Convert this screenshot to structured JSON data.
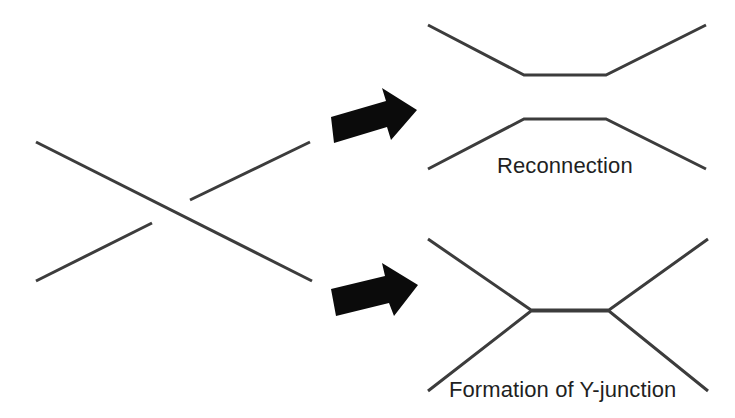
{
  "figure": {
    "background_color": "#ffffff",
    "stroke_color": "#3c3c3c",
    "arrow_color": "#0b0b0b",
    "text_color": "#221f1f"
  },
  "panels": {
    "left": {
      "name": "crossing-strands",
      "description": "Two straight strands crossing in an X, one broken at the crossing point"
    },
    "top_right": {
      "name": "reconnection-result",
      "caption": "Reconnection"
    },
    "bottom_right": {
      "name": "y-junction-result",
      "caption": "Formation of Y-junction"
    }
  },
  "captions": {
    "reconnection": "Reconnection",
    "y_junction": "Formation of Y-junction"
  },
  "geometry": {
    "crossing": {
      "descending_strand": "M36,142 L312,281",
      "ascending_segment_lower_left": "M36,281 L152,223",
      "ascending_segment_upper_right": "M190,200 L310,142"
    },
    "arrows": {
      "upper": "M331,117 L386,101 L382,88 L417,110 L391,140 L387,127 L334,143 Z",
      "lower": "M331,289 L385,276 L382,263 L418,285 L394,316 L389,303 L336,316 Z"
    },
    "reconnection_trough": "M428,25 L524,75 L606,75 L706,25",
    "reconnection_plateau": "M428,169 L524,119 L606,119 L706,169",
    "y_junction_upper": "M428,239 L531,310 L609,310 L708,239",
    "y_junction_lower": "M428,391 L531,311 L609,311 L708,391"
  },
  "labels": {
    "reconnection": {
      "text": "Reconnection",
      "x": 497,
      "y": 173
    },
    "y_junction": {
      "text": "Formation of Y-junction",
      "x": 449,
      "y": 397
    }
  }
}
